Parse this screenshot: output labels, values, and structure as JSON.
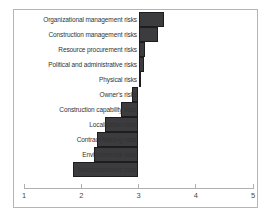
{
  "chart_data": {
    "type": "bar",
    "orientation": "horizontal",
    "title": "",
    "xlabel": "",
    "ylabel": "",
    "categories": [
      "Organizational management risks",
      "Construction management risks",
      "Resource procurement risks",
      "Political and administrative risks",
      "Physical risks",
      "Owner's risks",
      "Construction capability risks",
      "Localization risks",
      "Contract bidding risks",
      "Environmental risks",
      "Macroeconomic risks"
    ],
    "values": [
      3.44,
      3.34,
      3.12,
      3.09,
      3.05,
      2.89,
      2.7,
      2.42,
      2.27,
      2.22,
      1.85
    ],
    "baseline": 3,
    "xlim": [
      1,
      5
    ],
    "xticks": [
      1,
      2,
      3,
      4,
      5
    ],
    "grid": false,
    "legend": false,
    "colors": {
      "bar_fill": "#3c3c3e",
      "bar_border": "#1d1d1f",
      "axis_line": "#b0b0b0",
      "tick_label": "#4a4a4a",
      "category_label": "#333333",
      "frame_border": "#b5b5b5",
      "background": "#ffffff"
    }
  }
}
